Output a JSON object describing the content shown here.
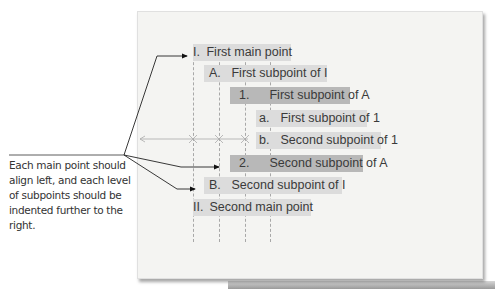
{
  "outline": {
    "items": [
      {
        "marker": "I.",
        "text": "First main point",
        "level": 0
      },
      {
        "marker": "A.",
        "text": "First subpoint of I",
        "level": 1
      },
      {
        "marker": "1.",
        "text": "First subpoint of A",
        "level": 2
      },
      {
        "marker": "a.",
        "text": "First subpoint of 1",
        "level": 3
      },
      {
        "marker": "b.",
        "text": "Second subpoint of 1",
        "level": 3
      },
      {
        "marker": "2.",
        "text": "Second subpoint of A",
        "level": 2
      },
      {
        "marker": "B.",
        "text": "Second subpoint of I",
        "level": 1
      },
      {
        "marker": "II.",
        "text": "Second main point",
        "level": 0
      }
    ]
  },
  "callout": {
    "text": "Each main point should align left, and each level of subpoints should be indented further to the right."
  },
  "colors": {
    "page": "#f4f4f2",
    "highlight_light": "#dcdcdc",
    "highlight_dark": "#b8b8b8",
    "guide_line": "#a8a8a8",
    "text": "#3a3a3a"
  }
}
